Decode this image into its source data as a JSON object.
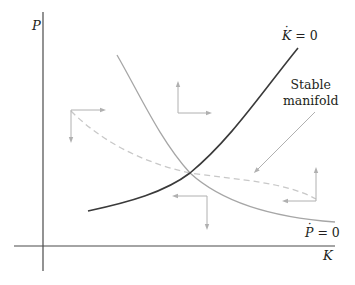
{
  "diagram": {
    "type": "phase-diagram",
    "axes": {
      "y_label": "P",
      "x_label": "K"
    },
    "curves": {
      "k_dot_zero": {
        "var": "K",
        "equation": "= 0",
        "color": "#3a3a3a"
      },
      "p_dot_zero": {
        "var": "P",
        "equation": "= 0",
        "color": "#a6a6a6"
      },
      "stable_manifold": {
        "line1": "Stable",
        "line2": "manifold",
        "color": "#c8c8c8",
        "style": "dashed"
      }
    },
    "arrow_color": "#b0b0b0",
    "axis_color": "#4a4a4a"
  }
}
